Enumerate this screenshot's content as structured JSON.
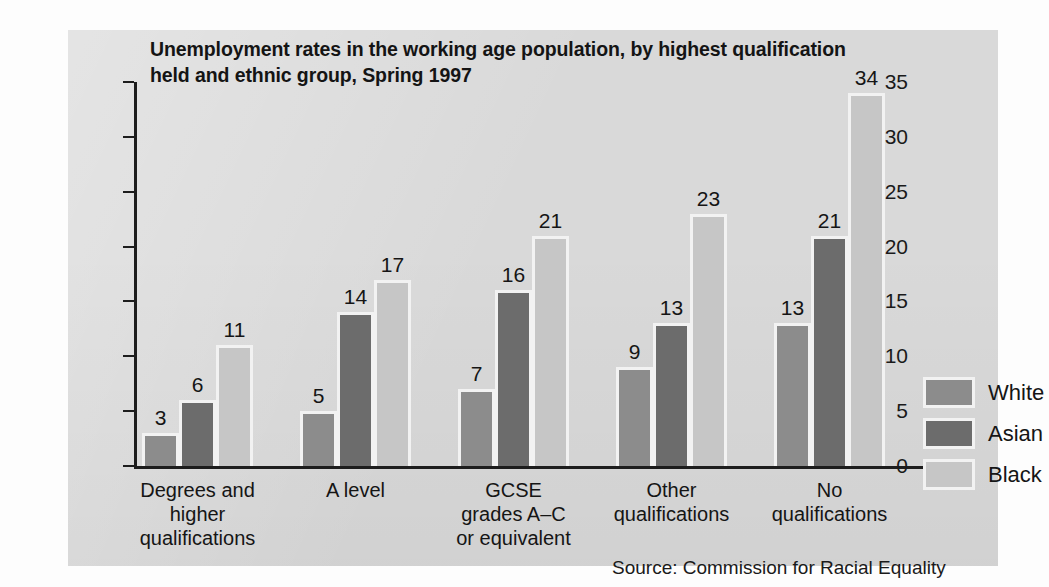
{
  "chart_data": {
    "type": "bar",
    "title": "Unemployment rates in the working age population, by highest qualification held and ethnic group, Spring 1997",
    "xlabel": "",
    "ylabel": "",
    "ylim": [
      0,
      35
    ],
    "yticks": [
      0,
      5,
      10,
      15,
      20,
      25,
      30,
      35
    ],
    "grid": false,
    "legend_position": "right",
    "categories": [
      "Degrees and\nhigher\nqualifications",
      "A level",
      "GCSE\ngrades A–C\nor equivalent",
      "Other\nqualifications",
      "No\nqualifications"
    ],
    "series": [
      {
        "name": "White",
        "color": "#8c8c8c",
        "values": [
          3,
          5,
          7,
          9,
          13
        ]
      },
      {
        "name": "Asian",
        "color": "#6c6c6c",
        "values": [
          6,
          14,
          16,
          13,
          21
        ]
      },
      {
        "name": "Black",
        "color": "#c6c6c6",
        "values": [
          11,
          17,
          21,
          23,
          34
        ]
      }
    ],
    "source": "Source: Commission for Racial Equality"
  }
}
